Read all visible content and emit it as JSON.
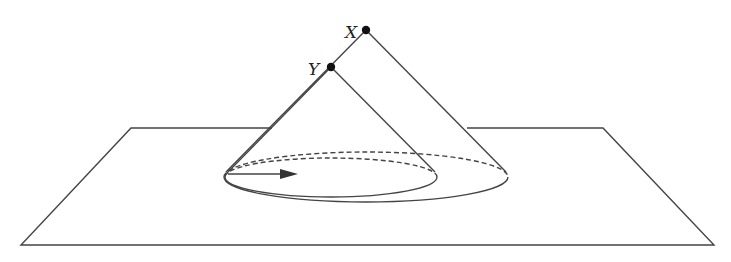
{
  "diagram": {
    "type": "light-cone-illustration",
    "colors": {
      "stroke": "#444444",
      "background": "#ffffff",
      "point": "#111111"
    },
    "points": [
      {
        "id": "X",
        "label": "X",
        "x": 366,
        "y": 30
      },
      {
        "id": "Y",
        "label": "Y",
        "x": 331,
        "y": 67
      }
    ],
    "plane": {
      "corners": [
        [
          131,
          128
        ],
        [
          603,
          128
        ],
        [
          714,
          245
        ],
        [
          21,
          245
        ]
      ]
    },
    "cones": [
      {
        "apex": "X",
        "base_ellipse": {
          "cx": 366,
          "cy": 181,
          "rx": 142,
          "ry": 25
        }
      },
      {
        "apex": "Y",
        "base_ellipse": {
          "cx": 331,
          "cy": 177,
          "rx": 106,
          "ry": 20
        }
      }
    ],
    "arrow": {
      "from": [
        228,
        174
      ],
      "to": [
        298,
        174
      ]
    }
  }
}
